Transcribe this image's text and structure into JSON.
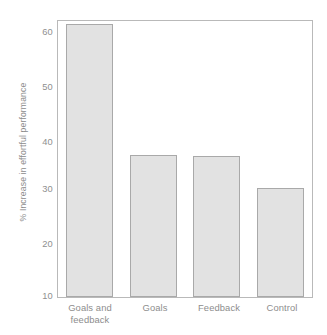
{
  "chart_data": {
    "type": "bar",
    "title": "",
    "subtitle": "",
    "xlabel": "",
    "ylabel": "% Increase in effortful performance",
    "categories": [
      "Goals and feedback",
      "Goals",
      "Feedback",
      "Control"
    ],
    "category_lines": [
      [
        "Goals and",
        "feedback"
      ],
      [
        "Goals"
      ],
      [
        "Feedback"
      ],
      [
        "Control"
      ]
    ],
    "values": [
      59.5,
      35.7,
      35.5,
      29.7
    ],
    "ylim": [
      10,
      60
    ],
    "yticks": [
      10,
      20,
      30,
      40,
      50,
      60
    ],
    "ytick_labels": [
      "10",
      "20",
      "30",
      "40",
      "50",
      "60"
    ],
    "grid": false,
    "legend": "none",
    "bar_fill_color": "#e2e2e2",
    "bar_edge_color": "#a9a9a9",
    "axis_color": "#b9b9b9",
    "text_color": "#8d8d8d",
    "background_color": "#ffffff"
  }
}
